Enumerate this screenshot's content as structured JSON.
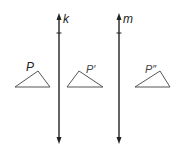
{
  "diagram": {
    "lines": [
      {
        "label": "k",
        "x": 59,
        "y1": 14,
        "y2": 143
      },
      {
        "label": "m",
        "x": 119,
        "y1": 14,
        "y2": 143
      }
    ],
    "triangles": [
      {
        "label": "P",
        "points": [
          [
            15,
            87
          ],
          [
            50,
            87
          ],
          [
            38,
            71
          ]
        ],
        "label_pos": [
          27,
          61
        ]
      },
      {
        "label": "P′",
        "points": [
          [
            67,
            87
          ],
          [
            103,
            87
          ],
          [
            79,
            71
          ]
        ],
        "label_pos": [
          85,
          64
        ]
      },
      {
        "label": "P″",
        "points": [
          [
            135,
            87
          ],
          [
            170,
            87
          ],
          [
            160,
            71
          ]
        ],
        "label_pos": [
          146,
          64
        ]
      }
    ],
    "colors": {
      "line": "#222222",
      "triangle": "#555555",
      "text": "#222222"
    }
  }
}
